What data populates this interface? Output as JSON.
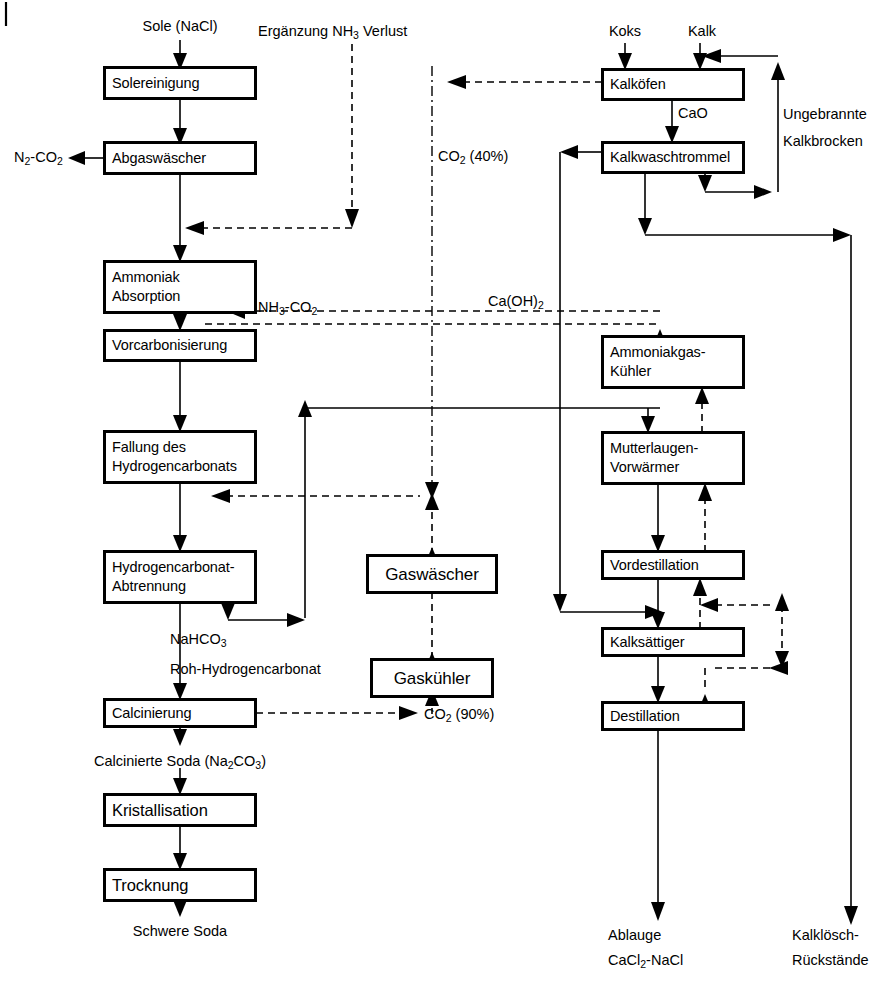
{
  "diagram": {
    "page_mark": "|"
  },
  "boxes": {
    "solereinigung": {
      "label": "Solereinigung"
    },
    "abgaswaescher": {
      "label": "Abgaswäscher"
    },
    "ammoniak_absorption": {
      "line1": "Ammoniak",
      "line2": "Absorption"
    },
    "vorcarbonisierung": {
      "label": "Vorcarbonisierung"
    },
    "fallung": {
      "line1": "Fallung des",
      "line2": "Hydrogencarbonats"
    },
    "abtrennung": {
      "line1": "Hydrogencarbonat-",
      "line2": "Abtrennung"
    },
    "calcinierung": {
      "label": "Calcinierung"
    },
    "kristallisation": {
      "label": "Kristallisation"
    },
    "trocknung": {
      "label": "Trocknung"
    },
    "gaswaescher": {
      "label": "Gaswäscher"
    },
    "gaskuehler": {
      "label": "Gaskühler"
    },
    "kalkoefen": {
      "label": "Kalköfen"
    },
    "kalkwaschtrommel": {
      "label": "Kalkwaschtrommel"
    },
    "ammoniakgas_kuehler": {
      "line1": "Ammoniakgas-",
      "line2": "Kühler"
    },
    "mutterlaugen_vorwaermer": {
      "line1": "Mutterlaugen-",
      "line2": "Vorwärmer"
    },
    "vordestillation": {
      "label": "Vordestillation"
    },
    "kalksaettiger": {
      "label": "Kalksättiger"
    },
    "destillation": {
      "label": "Destillation"
    }
  },
  "labels": {
    "sole_input": "Sole (NaCl)",
    "ergaenzung": "Ergänzung NH",
    "ergaenzung_sub": "3",
    "ergaenzung_tail": " Verlust",
    "koks": "Koks",
    "kalk": "Kalk",
    "n2_co2": "N",
    "n2_co2_sub1": "2",
    "n2_co2_mid": "-CO",
    "n2_co2_sub2": "2",
    "cao": "CaO",
    "ungebrannte_1": "Ungebrannte",
    "ungebrannte_2": "Kalkbrocken",
    "co2_40": "CO",
    "co2_40_sub": "2",
    "co2_40_tail": " (40%)",
    "nh3_co2": "NH",
    "nh3_co2_sub1": "3",
    "nh3_co2_mid": "-CO",
    "nh3_co2_sub2": "2",
    "ca_oh2": "Ca(OH)",
    "ca_oh2_sub": "2",
    "nahco3": "NaHCO",
    "nahco3_sub": "3",
    "roh_hydrogencarbonat": "Roh-Hydrogencarbonat",
    "co2_90": "CO",
    "co2_90_sub": "2",
    "co2_90_tail": " (90%)",
    "calcinierte_soda": "Calcinierte Soda (Na",
    "calcinierte_soda_sub": "2",
    "calcinierte_soda_mid": "CO",
    "calcinierte_soda_sub2": "3",
    "calcinierte_soda_tail": ")",
    "schwere_soda": "Schwere Soda",
    "ablauge_1": "Ablauge",
    "ablauge_2": "CaCl",
    "ablauge_2_sub": "2",
    "ablauge_2_tail": "-NaCl",
    "kalkloesch_1": "Kalklösch-",
    "kalkloesch_2": "Rückstände"
  },
  "style": {
    "line_color": "#000000",
    "box_fill": "#ffffff",
    "background": "#ffffff"
  }
}
